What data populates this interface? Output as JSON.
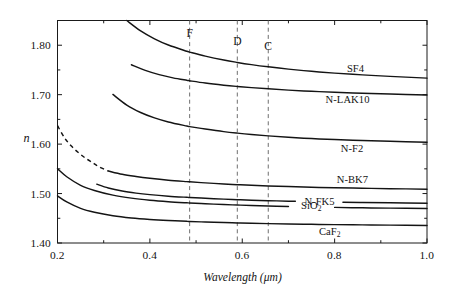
{
  "chart_data": {
    "type": "line",
    "title": "",
    "xlabel": "Wavelength (μm)",
    "ylabel": "n",
    "xlim": [
      0.2,
      1.0
    ],
    "ylim": [
      1.4,
      1.85
    ],
    "grid": false,
    "legend_position": "inline-right",
    "x_ticks": [
      "0.2",
      "0.4",
      "0.6",
      "0.8",
      "1.0"
    ],
    "x_tick_values": [
      0.2,
      0.4,
      0.6,
      0.8,
      1.0
    ],
    "x_minor_ticks": [
      0.3,
      0.5,
      0.7,
      0.9
    ],
    "y_ticks": [
      "1.40",
      "1.50",
      "1.60",
      "1.70",
      "1.80"
    ],
    "y_tick_values": [
      1.4,
      1.5,
      1.6,
      1.7,
      1.8
    ],
    "y_minor_ticks": [
      1.45,
      1.55,
      1.65,
      1.75,
      1.85
    ],
    "annotations": [
      {
        "label": "F",
        "x": 0.4861,
        "note": "F spectral line"
      },
      {
        "label": "D",
        "x": 0.5893,
        "note": "D spectral line"
      },
      {
        "label": "C",
        "x": 0.6563,
        "note": "C spectral line"
      }
    ],
    "series": [
      {
        "name": "SF4",
        "label": "SF4",
        "style": "solid",
        "x": [
          0.35,
          0.38,
          0.41,
          0.44,
          0.48,
          0.4861,
          0.52,
          0.56,
          0.5893,
          0.62,
          0.6563,
          0.7,
          0.75,
          0.8,
          0.86,
          0.92,
          1.0
        ],
        "y": [
          1.85,
          1.829,
          1.813,
          1.8005,
          1.7878,
          1.7861,
          1.778,
          1.77,
          1.7652,
          1.7608,
          1.7563,
          1.7516,
          1.7472,
          1.7436,
          1.74,
          1.737,
          1.7335
        ]
      },
      {
        "name": "N-LAK10",
        "label": "N-LAK10",
        "style": "solid",
        "x": [
          0.36,
          0.39,
          0.42,
          0.45,
          0.48,
          0.4861,
          0.52,
          0.56,
          0.5893,
          0.62,
          0.6563,
          0.7,
          0.75,
          0.8,
          0.86,
          0.92,
          1.0
        ],
        "y": [
          1.7605,
          1.749,
          1.7405,
          1.734,
          1.729,
          1.7281,
          1.7235,
          1.7192,
          1.7166,
          1.7142,
          1.7118,
          1.7092,
          1.7068,
          1.7048,
          1.7028,
          1.7012,
          1.6993
        ]
      },
      {
        "name": "N-F2",
        "label": "N-F2",
        "style": "solid",
        "x": [
          0.32,
          0.35,
          0.38,
          0.41,
          0.44,
          0.48,
          0.4861,
          0.52,
          0.56,
          0.5893,
          0.62,
          0.6563,
          0.7,
          0.75,
          0.8,
          0.86,
          0.92,
          1.0
        ],
        "y": [
          1.7005,
          1.679,
          1.664,
          1.653,
          1.6448,
          1.6365,
          1.6354,
          1.6305,
          1.6253,
          1.6222,
          1.6194,
          1.6166,
          1.6138,
          1.6112,
          1.6092,
          1.6072,
          1.6056,
          1.6038
        ]
      },
      {
        "name": "N-BK7",
        "label": "N-BK7",
        "style": "solid",
        "x": [
          0.31,
          0.34,
          0.37,
          0.4,
          0.44,
          0.48,
          0.4861,
          0.52,
          0.56,
          0.5893,
          0.62,
          0.6563,
          0.7,
          0.75,
          0.8,
          0.86,
          0.92,
          1.0
        ],
        "y": [
          1.5456,
          1.539,
          1.5345,
          1.5309,
          1.527,
          1.5241,
          1.5237,
          1.5216,
          1.5194,
          1.518,
          1.5167,
          1.5154,
          1.5141,
          1.5128,
          1.5118,
          1.5108,
          1.5099,
          1.5089
        ]
      },
      {
        "name": "N-BK7-extension",
        "label": "",
        "style": "dashed",
        "x": [
          0.2,
          0.215,
          0.23,
          0.245,
          0.26,
          0.275,
          0.29,
          0.31
        ],
        "y": [
          1.6373,
          1.613,
          1.596,
          1.583,
          1.572,
          1.563,
          1.554,
          1.5456
        ]
      },
      {
        "name": "N-FK5",
        "label": "N-FK5",
        "style": "solid",
        "x": [
          0.285,
          0.31,
          0.34,
          0.37,
          0.4,
          0.44,
          0.48,
          0.4861,
          0.52,
          0.56,
          0.5893,
          0.62,
          0.6563,
          0.7,
          0.75,
          0.8,
          0.86,
          0.92,
          1.0
        ],
        "y": [
          1.519,
          1.5113,
          1.5051,
          1.5009,
          1.4978,
          1.4947,
          1.4924,
          1.4921,
          1.4904,
          1.4887,
          1.4876,
          1.4866,
          1.4856,
          1.4846,
          1.4836,
          1.4828,
          1.482,
          1.4813,
          1.4805
        ]
      },
      {
        "name": "SiO2",
        "label": "SiO₂",
        "style": "solid",
        "x": [
          0.2,
          0.22,
          0.25,
          0.28,
          0.32,
          0.36,
          0.4,
          0.44,
          0.48,
          0.4861,
          0.52,
          0.56,
          0.5893,
          0.62,
          0.6563,
          0.7,
          0.75,
          0.8,
          0.86,
          0.92,
          1.0
        ],
        "y": [
          1.55,
          1.534,
          1.5167,
          1.5063,
          1.4968,
          1.4907,
          1.4866,
          1.4836,
          1.4813,
          1.481,
          1.4794,
          1.4778,
          1.4768,
          1.4758,
          1.4748,
          1.4738,
          1.4728,
          1.472,
          1.4712,
          1.4705,
          1.4697
        ]
      },
      {
        "name": "CaF2",
        "label": "CaF₂",
        "style": "solid",
        "x": [
          0.2,
          0.22,
          0.25,
          0.28,
          0.32,
          0.36,
          0.4,
          0.44,
          0.48,
          0.4861,
          0.52,
          0.56,
          0.5893,
          0.62,
          0.6563,
          0.7,
          0.75,
          0.8,
          0.86,
          0.92,
          1.0
        ],
        "y": [
          1.4952,
          1.483,
          1.47,
          1.4622,
          1.4552,
          1.4507,
          1.4477,
          1.4455,
          1.4438,
          1.4436,
          1.4424,
          1.4413,
          1.4406,
          1.4399,
          1.4392,
          1.4385,
          1.4378,
          1.4372,
          1.4366,
          1.4361,
          1.4355
        ]
      }
    ]
  },
  "axis": {
    "y_label": "n",
    "x_title": "Wavelength (μm)",
    "y_tick_0": "1.40",
    "y_tick_1": "1.50",
    "y_tick_2": "1.60",
    "y_tick_3": "1.70",
    "y_tick_4": "1.80",
    "x_tick_0": "0.2",
    "x_tick_1": "0.4",
    "x_tick_2": "0.6",
    "x_tick_3": "0.8",
    "x_tick_4": "1.0"
  },
  "reference_lines": {
    "f_label": "F",
    "d_label": "D",
    "c_label": "C"
  },
  "curve_labels": {
    "sf4": "SF4",
    "nlak10": "N-LAK10",
    "nf2": "N-F2",
    "nbk7": "N-BK7",
    "nfk5": "N-FK5",
    "sio2_main": "SiO",
    "sio2_sub": "2",
    "caf2_main": "CaF",
    "caf2_sub": "2"
  },
  "colors": {
    "curve": "#141414",
    "axis": "#1a1a1a",
    "refline": "#6f6f6f",
    "background": "#ffffff"
  }
}
